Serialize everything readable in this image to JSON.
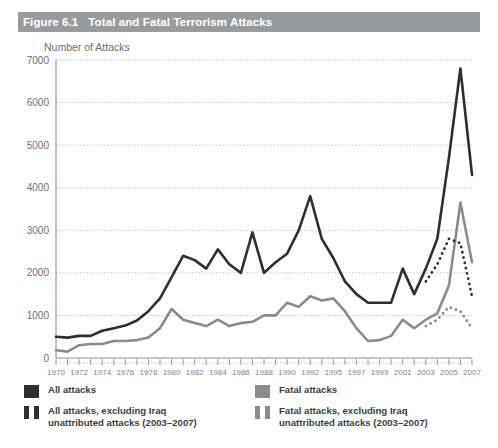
{
  "figure": {
    "number": "Figure 6.1",
    "title": "Total and Fatal Terrorism Attacks",
    "axis_title": "Number of Attacks"
  },
  "colors": {
    "title_bar": "#9a9b9d",
    "title_text": "#ffffff",
    "all_attacks": "#2f2f31",
    "fatal_attacks": "#8a8b8d",
    "grid": "#c9cacc",
    "axis": "#8d8e90",
    "label_text": "#6d6e70"
  },
  "legend": {
    "items": [
      {
        "label": "All attacks",
        "style": "solid",
        "color": "#2f2f31"
      },
      {
        "label": "Fatal attacks",
        "style": "solid",
        "color": "#8a8b8d"
      },
      {
        "label": "All attacks, excluding Iraq\nunattributed attacks (2003–2007)",
        "style": "dotted",
        "color": "#2f2f31"
      },
      {
        "label": "Fatal attacks, excluding Iraq\nunattributed attacks (2003–2007)",
        "style": "dotted",
        "color": "#8a8b8d"
      }
    ],
    "all_attacks_label": "All attacks",
    "fatal_attacks_label": "Fatal attacks",
    "all_attacks_ex_iraq_line1": "All attacks, excluding Iraq",
    "all_attacks_ex_iraq_line2": "unattributed attacks (2003–2007)",
    "fatal_attacks_ex_iraq_line1": "Fatal attacks, excluding Iraq",
    "fatal_attacks_ex_iraq_line2": "unattributed attacks (2003–2007)"
  },
  "chart_data": {
    "type": "line",
    "title": "Total and Fatal Terrorism Attacks",
    "xlabel": "",
    "ylabel": "Number of Attacks",
    "ylim": [
      0,
      7000
    ],
    "yticks": [
      0,
      1000,
      2000,
      3000,
      4000,
      5000,
      6000,
      7000
    ],
    "ytick_labels": [
      "0",
      "1000",
      "2000",
      "3000",
      "4000",
      "5000",
      "6000",
      "7000"
    ],
    "grid": true,
    "legend_position": "below",
    "x": [
      1970,
      1971,
      1972,
      1973,
      1974,
      1975,
      1976,
      1977,
      1978,
      1979,
      1980,
      1981,
      1982,
      1983,
      1984,
      1985,
      1986,
      1987,
      1988,
      1989,
      1990,
      1991,
      1992,
      1994,
      1995,
      1996,
      1997,
      1998,
      1999,
      2000,
      2001,
      2002,
      2003,
      2004,
      2005,
      2006,
      2007
    ],
    "xtick_labels": [
      "1970",
      "",
      "1972",
      "",
      "1974",
      "",
      "1976",
      "",
      "1978",
      "",
      "1980",
      "",
      "1982",
      "",
      "1984",
      "",
      "1986",
      "",
      "1988",
      "",
      "1990",
      "",
      "1992",
      "",
      "1995",
      "",
      "1997",
      "",
      "1999",
      "",
      "2001",
      "",
      "2003",
      "",
      "2005",
      "",
      "2007"
    ],
    "series": [
      {
        "name": "All attacks",
        "color": "#2f2f31",
        "style": "solid",
        "values": [
          500,
          480,
          520,
          520,
          640,
          700,
          760,
          880,
          1100,
          1400,
          1900,
          2400,
          2300,
          2100,
          2550,
          2200,
          2000,
          2950,
          2000,
          2250,
          2450,
          3000,
          3800,
          2800,
          2350,
          1800,
          1500,
          1300,
          1300,
          1300,
          2100,
          1500,
          2100,
          2800,
          4700,
          6800,
          4300
        ]
      },
      {
        "name": "Fatal attacks",
        "color": "#8a8b8d",
        "style": "solid",
        "values": [
          180,
          150,
          300,
          330,
          330,
          400,
          400,
          420,
          480,
          700,
          1150,
          900,
          820,
          750,
          900,
          750,
          820,
          850,
          1000,
          1000,
          1300,
          1200,
          1450,
          1350,
          1400,
          1100,
          700,
          400,
          420,
          520,
          900,
          700,
          900,
          1050,
          1700,
          3650,
          2250
        ]
      },
      {
        "name": "All attacks, excluding Iraq unattributed attacks (2003–2007)",
        "color": "#2f2f31",
        "style": "dotted",
        "x": [
          2003,
          2004,
          2005,
          2006,
          2007
        ],
        "values": [
          1800,
          2200,
          2800,
          2700,
          1450
        ]
      },
      {
        "name": "Fatal attacks, excluding Iraq unattributed attacks (2003–2007)",
        "color": "#8a8b8d",
        "style": "dotted",
        "x": [
          2003,
          2004,
          2005,
          2006,
          2007
        ],
        "values": [
          750,
          900,
          1200,
          1100,
          700
        ]
      }
    ]
  }
}
